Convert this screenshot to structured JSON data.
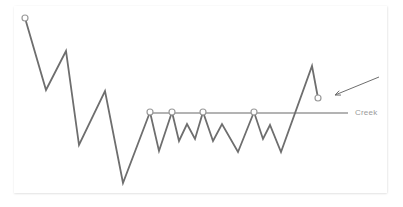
{
  "chart_data": {
    "type": "line",
    "title": "",
    "xlabel": "",
    "ylabel": "",
    "grid": false,
    "series": [
      {
        "name": "price",
        "points": [
          [
            25,
            18
          ],
          [
            46,
            90
          ],
          [
            66,
            51
          ],
          [
            79,
            145
          ],
          [
            105,
            91
          ],
          [
            123,
            183
          ],
          [
            150,
            112
          ],
          [
            159,
            151
          ],
          [
            172,
            112
          ],
          [
            179,
            141
          ],
          [
            187,
            124
          ],
          [
            195,
            139
          ],
          [
            203,
            112
          ],
          [
            213,
            141
          ],
          [
            222,
            124
          ],
          [
            238,
            152
          ],
          [
            254,
            112
          ],
          [
            263,
            139
          ],
          [
            270,
            125
          ],
          [
            281,
            152
          ],
          [
            312,
            66
          ],
          [
            318,
            98
          ]
        ]
      }
    ],
    "markers": [
      [
        25,
        18
      ],
      [
        150,
        112
      ],
      [
        172,
        112
      ],
      [
        203,
        112
      ],
      [
        254,
        112
      ],
      [
        318,
        98
      ]
    ],
    "reference_line": {
      "label": "Creek",
      "y": 113,
      "x_start": 147,
      "x_end": 348
    },
    "annotations": [
      {
        "type": "arrow",
        "from": [
          379,
          77
        ],
        "to": [
          335,
          95
        ]
      }
    ]
  },
  "labels": {
    "creek": "Creek"
  },
  "colors": {
    "line": "#6e6e6e",
    "creek": "#9a9a9a",
    "marker_fill": "#ffffff"
  }
}
